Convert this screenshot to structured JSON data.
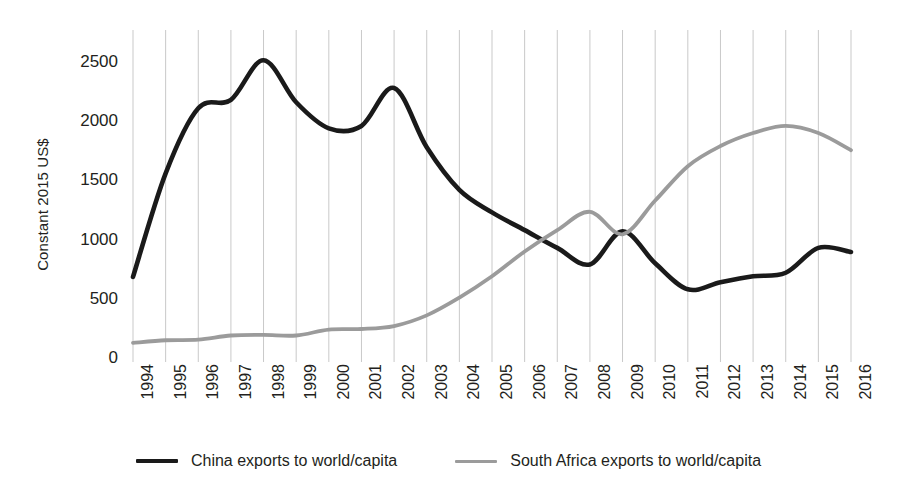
{
  "chart_data": {
    "type": "line",
    "title": "",
    "xlabel": "",
    "ylabel": "Constant 2015 US$",
    "x": [
      "1994",
      "1995",
      "1996",
      "1997",
      "1998",
      "1999",
      "2000",
      "2001",
      "2002",
      "2003",
      "2004",
      "2005",
      "2006",
      "2007",
      "2008",
      "2009",
      "2010",
      "2011",
      "2012",
      "2013",
      "2014",
      "2015",
      "2016"
    ],
    "categories": [
      "1994",
      "1995",
      "1996",
      "1997",
      "1998",
      "1999",
      "2000",
      "2001",
      "2002",
      "2003",
      "2004",
      "2005",
      "2006",
      "2007",
      "2008",
      "2009",
      "2010",
      "2011",
      "2012",
      "2013",
      "2014",
      "2015",
      "2016"
    ],
    "series": [
      {
        "name": "China exports to world/capita",
        "color": "#1a1a1a",
        "values": [
          685,
          1560,
          2110,
          2180,
          2515,
          2160,
          1940,
          1960,
          2280,
          1780,
          1420,
          1230,
          1080,
          930,
          790,
          1070,
          800,
          580,
          640,
          690,
          720,
          930,
          895
        ]
      },
      {
        "name": "South Africa exports to world/capita",
        "color": "#9b9b9b",
        "values": [
          128,
          150,
          155,
          190,
          195,
          190,
          240,
          245,
          270,
          360,
          510,
          690,
          900,
          1080,
          1235,
          1045,
          1330,
          1620,
          1790,
          1900,
          1960,
          1900,
          1755
        ]
      }
    ],
    "ylim": [
      0,
      2600
    ],
    "yticks": [
      "0",
      "500",
      "1000",
      "1500",
      "2000",
      "2500"
    ],
    "ytick_values": [
      0,
      500,
      1000,
      1500,
      2000,
      2500
    ],
    "grid": "vertical-only",
    "gridline_color": "#c9c9c9",
    "legend_position": "bottom-center",
    "background": "#ffffff"
  },
  "legend": {
    "entries": [
      {
        "label": "China exports to world/capita",
        "color": "#1a1a1a"
      },
      {
        "label": "South Africa exports to world/capita",
        "color": "#9b9b9b"
      }
    ]
  }
}
